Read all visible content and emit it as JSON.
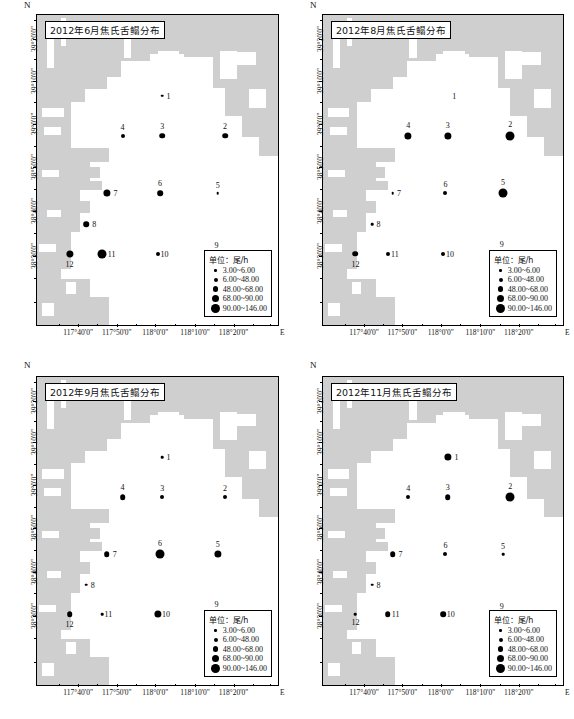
{
  "figure": {
    "panel_count": 4,
    "north_label": "N",
    "east_label": "E"
  },
  "axes": {
    "x_ticks": [
      "117°40'0\"",
      "117°50'0\"",
      "118°0'0\"",
      "118°10'0\"",
      "118°20'0\""
    ],
    "y_ticks": [
      "39°20'0\"",
      "39°10'0\"",
      "39°0'0\"",
      "38°50'0\"",
      "38°40'0\"",
      "38°30'0\""
    ],
    "xlabel": "E",
    "ylabel": "N"
  },
  "legend": {
    "title": "单位：尾/h",
    "classes": [
      {
        "label": "3.00~6.00",
        "size": 2.6
      },
      {
        "label": "6.00~48.00",
        "size": 4.0
      },
      {
        "label": "48.00~68.00",
        "size": 5.6
      },
      {
        "label": "68.00~90.00",
        "size": 7.2
      },
      {
        "label": "90.00~146.00",
        "size": 9.0
      }
    ]
  },
  "chart_data": {
    "type": "scatter",
    "xlabel": "Longitude (E)",
    "ylabel": "Latitude (N)",
    "xlim": [
      "117°33'0\"",
      "118°24'0\""
    ],
    "ylim": [
      "38°25'0\"",
      "39°24'0\""
    ],
    "unit": "尾/h",
    "size_classes": [
      "3.00~6.00",
      "6.00~48.00",
      "48.00~68.00",
      "68.00~90.00",
      "90.00~146.00"
    ],
    "stations": [
      {
        "id": "1",
        "x": 52.0,
        "y": 26.0
      },
      {
        "id": "2",
        "x": 78.0,
        "y": 39.0
      },
      {
        "id": "3",
        "x": 52.0,
        "y": 39.0
      },
      {
        "id": "4",
        "x": 35.5,
        "y": 39.0
      },
      {
        "id": "5",
        "x": 75.0,
        "y": 57.5
      },
      {
        "id": "6",
        "x": 51.0,
        "y": 57.5
      },
      {
        "id": "7",
        "x": 29.0,
        "y": 57.5
      },
      {
        "id": "8",
        "x": 20.5,
        "y": 67.5
      },
      {
        "id": "9",
        "x": 74.5,
        "y": 77.0
      },
      {
        "id": "10",
        "x": 50.0,
        "y": 77.0
      },
      {
        "id": "11",
        "x": 27.0,
        "y": 77.0
      },
      {
        "id": "12",
        "x": 13.5,
        "y": 77.0
      }
    ],
    "panels": [
      {
        "key": "jun",
        "title": "2012年6月焦氏舌鳎分布",
        "month": "6月",
        "series": [
          {
            "station": "1",
            "class": 1,
            "label_pos": "right"
          },
          {
            "station": "2",
            "class": 3,
            "label_pos": "above"
          },
          {
            "station": "3",
            "class": 3,
            "label_pos": "above"
          },
          {
            "station": "4",
            "class": 2,
            "label_pos": "above"
          },
          {
            "station": "5",
            "class": 1,
            "label_pos": "above"
          },
          {
            "station": "6",
            "class": 3,
            "label_pos": "above"
          },
          {
            "station": "7",
            "class": 4,
            "label_pos": "right"
          },
          {
            "station": "8",
            "class": 3,
            "label_pos": "right"
          },
          {
            "station": "9",
            "class": 1,
            "label_pos": "above"
          },
          {
            "station": "10",
            "class": 2,
            "label_pos": "right"
          },
          {
            "station": "11",
            "class": 5,
            "label_pos": "right"
          },
          {
            "station": "12",
            "class": 4,
            "label_pos": "below"
          }
        ]
      },
      {
        "key": "aug",
        "title": "2012年8月焦氏舌鳎分布",
        "month": "8月",
        "series": [
          {
            "station": "1",
            "class": 0,
            "label_pos": "right"
          },
          {
            "station": "2",
            "class": 5,
            "label_pos": "above"
          },
          {
            "station": "3",
            "class": 4,
            "label_pos": "above"
          },
          {
            "station": "4",
            "class": 4,
            "label_pos": "above"
          },
          {
            "station": "5",
            "class": 5,
            "label_pos": "above"
          },
          {
            "station": "6",
            "class": 2,
            "label_pos": "above"
          },
          {
            "station": "7",
            "class": 1,
            "label_pos": "right"
          },
          {
            "station": "8",
            "class": 1,
            "label_pos": "right"
          },
          {
            "station": "9",
            "class": 3,
            "label_pos": "above"
          },
          {
            "station": "10",
            "class": 2,
            "label_pos": "right"
          },
          {
            "station": "11",
            "class": 2,
            "label_pos": "right"
          },
          {
            "station": "12",
            "class": 3,
            "label_pos": "below"
          }
        ]
      },
      {
        "key": "sep",
        "title": "2012年9月焦氏舌鳎分布",
        "month": "9月",
        "series": [
          {
            "station": "1",
            "class": 1,
            "label_pos": "right"
          },
          {
            "station": "2",
            "class": 2,
            "label_pos": "above"
          },
          {
            "station": "3",
            "class": 2,
            "label_pos": "above"
          },
          {
            "station": "4",
            "class": 3,
            "label_pos": "above"
          },
          {
            "station": "5",
            "class": 4,
            "label_pos": "above"
          },
          {
            "station": "6",
            "class": 5,
            "label_pos": "above"
          },
          {
            "station": "7",
            "class": 3,
            "label_pos": "right"
          },
          {
            "station": "8",
            "class": 1,
            "label_pos": "right"
          },
          {
            "station": "9",
            "class": 3,
            "label_pos": "above"
          },
          {
            "station": "10",
            "class": 4,
            "label_pos": "right"
          },
          {
            "station": "11",
            "class": 1,
            "label_pos": "right"
          },
          {
            "station": "12",
            "class": 3,
            "label_pos": "below"
          }
        ]
      },
      {
        "key": "nov",
        "title": "2012年11月焦氏舌鳎分布",
        "month": "11月",
        "series": [
          {
            "station": "1",
            "class": 4,
            "label_pos": "right"
          },
          {
            "station": "2",
            "class": 5,
            "label_pos": "above"
          },
          {
            "station": "3",
            "class": 3,
            "label_pos": "above"
          },
          {
            "station": "4",
            "class": 2,
            "label_pos": "above"
          },
          {
            "station": "5",
            "class": 1,
            "label_pos": "above"
          },
          {
            "station": "6",
            "class": 2,
            "label_pos": "above"
          },
          {
            "station": "7",
            "class": 3,
            "label_pos": "right"
          },
          {
            "station": "8",
            "class": 1,
            "label_pos": "right"
          },
          {
            "station": "9",
            "class": 1,
            "label_pos": "above"
          },
          {
            "station": "10",
            "class": 3,
            "label_pos": "right"
          },
          {
            "station": "11",
            "class": 3,
            "label_pos": "right"
          },
          {
            "station": "12",
            "class": 1,
            "label_pos": "below"
          }
        ]
      }
    ]
  },
  "colors": {
    "land": "#cfcfcf",
    "sea": "#ffffff",
    "dot": "#000000",
    "frame": "#000000"
  }
}
